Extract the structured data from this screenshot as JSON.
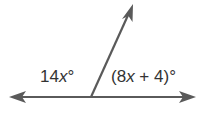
{
  "diagram": {
    "type": "adjacent-angles-linear-pair",
    "line_color": "#5a5a5a",
    "angles": [
      {
        "position": "left",
        "coefficient": "14",
        "variable": "x",
        "constant": "",
        "degree": "°",
        "text": "14x°"
      },
      {
        "position": "right",
        "open": "(",
        "coefficient": "8",
        "variable": "x",
        "operator": " + ",
        "constant": "4",
        "close": ")",
        "degree": "°",
        "text": "(8x + 4)°"
      }
    ],
    "line": {
      "x1": 10,
      "y1": 97,
      "x2": 195,
      "y2": 97
    },
    "ray": {
      "x1": 91,
      "y1": 97,
      "x2": 132,
      "y2": 5
    }
  }
}
